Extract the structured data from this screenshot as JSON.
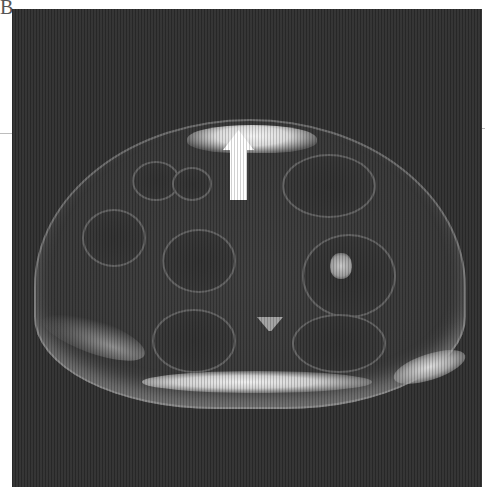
{
  "figure": {
    "panel_label": "B",
    "colors": {
      "background": "#2f2f2f",
      "arrow": "#ffffff",
      "page": "#ffffff"
    },
    "annotations": [
      {
        "type": "arrow",
        "direction": "up",
        "color": "#ffffff"
      }
    ]
  }
}
